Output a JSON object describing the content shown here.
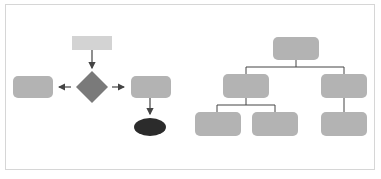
{
  "colors": {
    "box": "#b3b3b3",
    "start_box": "#d3d3d3",
    "decision": "#7a7a7a",
    "terminal": "#2b2b2b",
    "line": "#444444",
    "frame": "#d6d6d6"
  },
  "flowchart": {
    "nodes": [
      {
        "id": "start",
        "shape": "rectangle"
      },
      {
        "id": "decision",
        "shape": "diamond"
      },
      {
        "id": "left",
        "shape": "rounded-rect"
      },
      {
        "id": "right",
        "shape": "rounded-rect"
      },
      {
        "id": "end",
        "shape": "ellipse"
      }
    ],
    "edges": [
      {
        "from": "start",
        "to": "decision"
      },
      {
        "from": "decision",
        "to": "left"
      },
      {
        "from": "decision",
        "to": "right"
      },
      {
        "from": "right",
        "to": "end"
      }
    ]
  },
  "tree": {
    "nodes": [
      {
        "id": "root",
        "level": 0
      },
      {
        "id": "child-1",
        "level": 1
      },
      {
        "id": "child-2",
        "level": 1
      },
      {
        "id": "leaf-1",
        "level": 2
      },
      {
        "id": "leaf-2",
        "level": 2
      },
      {
        "id": "leaf-3",
        "level": 2
      }
    ],
    "edges": [
      {
        "from": "root",
        "to": "child-1"
      },
      {
        "from": "root",
        "to": "child-2"
      },
      {
        "from": "child-1",
        "to": "leaf-1"
      },
      {
        "from": "child-1",
        "to": "leaf-2"
      },
      {
        "from": "child-2",
        "to": "leaf-3"
      }
    ]
  }
}
